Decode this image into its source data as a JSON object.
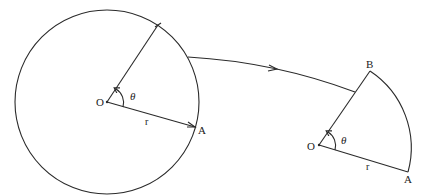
{
  "diagram": {
    "left_figure": {
      "center_label": "O",
      "point_label": "A",
      "radius_label": "r",
      "angle_label": "θ"
    },
    "right_figure": {
      "center_label": "O",
      "point_a_label": "A",
      "point_b_label": "B",
      "radius_label": "r",
      "angle_label": "θ"
    },
    "colors": {
      "line": "#2a2a2a",
      "background": "#ffffff"
    }
  }
}
